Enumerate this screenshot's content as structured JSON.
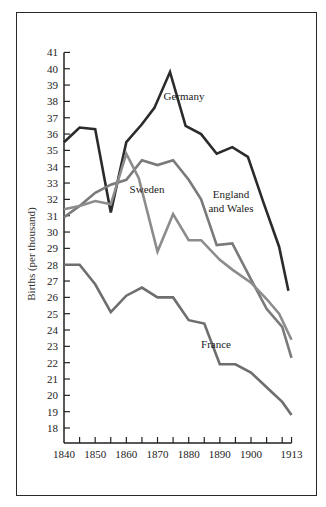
{
  "chart_data": {
    "type": "line",
    "title": "",
    "xlabel": "",
    "ylabel": "Births (per thousand)",
    "ylim": [
      17,
      41
    ],
    "xlim": [
      1840,
      1913
    ],
    "yticks": [
      18,
      19,
      20,
      21,
      22,
      23,
      24,
      25,
      26,
      27,
      28,
      29,
      30,
      31,
      32,
      33,
      34,
      35,
      36,
      37,
      38,
      39,
      40,
      41
    ],
    "xtick_labels": [
      "1840",
      "1850",
      "1860",
      "1870",
      "1880",
      "1890",
      "1900",
      "1913"
    ],
    "xtick_label_years": [
      1840,
      1850,
      1860,
      1870,
      1880,
      1890,
      1900,
      1913
    ],
    "xtick_marks": [
      1845,
      1850,
      1855,
      1860,
      1865,
      1870,
      1875,
      1880,
      1885,
      1890,
      1895,
      1900,
      1905,
      1910,
      1913
    ],
    "grid": false,
    "legend": "inline labels",
    "series": [
      {
        "name": "Germany",
        "label_lines": [
          "Germany"
        ],
        "color": "#2b2b2b",
        "label_pos": [
          184,
          100
        ],
        "x": [
          1840,
          1845,
          1850,
          1855,
          1860,
          1865,
          1869,
          1874,
          1879,
          1884,
          1889,
          1894,
          1899,
          1904,
          1909,
          1912
        ],
        "y": [
          35.5,
          36.4,
          36.3,
          31.2,
          35.5,
          36.6,
          37.6,
          39.8,
          36.5,
          36.0,
          34.8,
          35.2,
          34.6,
          31.8,
          29.1,
          26.4
        ]
      },
      {
        "name": "England and Wales",
        "label_lines": [
          "England",
          "and Wales"
        ],
        "color": "#7a7a7a",
        "label_pos": [
          231,
          198
        ],
        "x": [
          1840,
          1845,
          1850,
          1855,
          1860,
          1865,
          1870,
          1875,
          1880,
          1884,
          1889,
          1894,
          1900,
          1905,
          1910,
          1913
        ],
        "y": [
          30.9,
          31.6,
          32.4,
          32.9,
          33.2,
          34.4,
          34.1,
          34.4,
          33.2,
          32.0,
          29.2,
          29.3,
          27.1,
          25.3,
          24.2,
          22.3
        ]
      },
      {
        "name": "Sweden",
        "label_lines": [
          "Sweden"
        ],
        "color": "#8c8c8c",
        "label_pos": [
          147,
          193
        ],
        "x": [
          1840,
          1845,
          1850,
          1855,
          1860,
          1864,
          1870,
          1875,
          1880,
          1884,
          1890,
          1894,
          1900,
          1905,
          1909,
          1913
        ],
        "y": [
          31.4,
          31.6,
          31.9,
          31.7,
          34.8,
          33.3,
          28.8,
          31.1,
          29.5,
          29.5,
          28.3,
          27.7,
          26.9,
          25.9,
          25.0,
          23.4
        ]
      },
      {
        "name": "France",
        "label_lines": [
          "France"
        ],
        "color": "#6e6e6e",
        "label_pos": [
          216,
          348
        ],
        "x": [
          1840,
          1845,
          1850,
          1855,
          1860,
          1865,
          1870,
          1875,
          1880,
          1885,
          1890,
          1895,
          1900,
          1905,
          1910,
          1913
        ],
        "y": [
          28.0,
          28.0,
          26.8,
          25.1,
          26.1,
          26.6,
          26.0,
          26.0,
          24.6,
          24.4,
          21.9,
          21.9,
          21.4,
          20.5,
          19.6,
          18.8
        ]
      }
    ]
  }
}
